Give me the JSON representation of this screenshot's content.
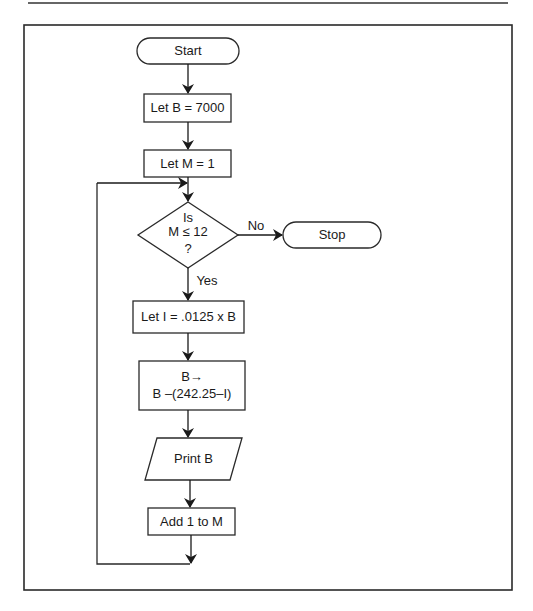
{
  "figure": {
    "type": "flowchart",
    "colors": {
      "stroke": "#2a2a2a",
      "background": "#ffffff"
    }
  },
  "nodes": {
    "start": {
      "shape": "terminator",
      "label": "Start"
    },
    "init_b": {
      "shape": "process",
      "label": "Let B = 7000"
    },
    "init_m": {
      "shape": "process",
      "label": "Let M = 1"
    },
    "decision": {
      "shape": "decision",
      "line1": "Is",
      "line2": "M ≤ 12",
      "line3": "?"
    },
    "stop": {
      "shape": "terminator",
      "label": "Stop"
    },
    "interest": {
      "shape": "process",
      "label": "Let I = .0125 x B"
    },
    "update_b": {
      "shape": "process",
      "line1": "B→",
      "line2": "B –(242.25–I)"
    },
    "print_b": {
      "shape": "io",
      "label": "Print B"
    },
    "increment": {
      "shape": "process",
      "label": "Add 1 to M"
    }
  },
  "edges": {
    "no_label": "No",
    "yes_label": "Yes"
  }
}
